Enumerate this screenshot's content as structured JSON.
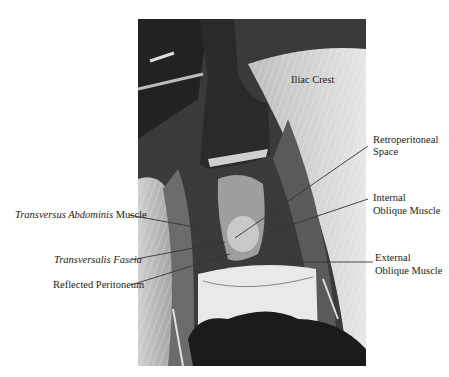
{
  "figure": {
    "labels": {
      "iliac_crest": "Iliac Crest",
      "retroperitoneal_space_line1": "Retroperitoneal",
      "retroperitoneal_space_line2": "Space",
      "internal_oblique_line1": "Internal",
      "internal_oblique_line2": "Oblique Muscle",
      "external_oblique_line1": "External",
      "external_oblique_line2": "Oblique Muscle",
      "transversus_abdominis_italic": "Transversus Abdominis",
      "transversus_abdominis_suffix": " Muscle",
      "transversalis_fascia": "Transversalis Fascia",
      "reflected_peritoneum": "Reflected Peritoneum"
    }
  }
}
